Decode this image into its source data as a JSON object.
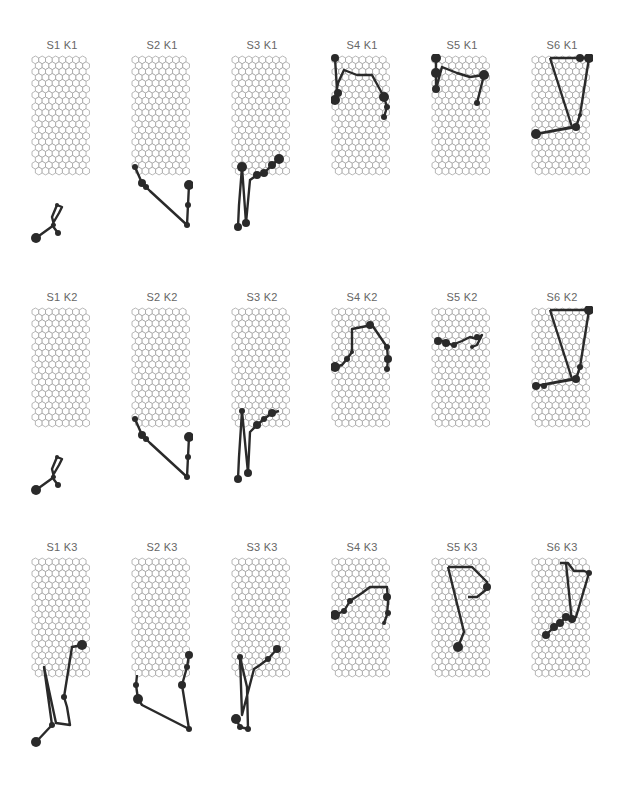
{
  "figure": {
    "grid": {
      "cols": 8,
      "rows": 20,
      "line_color": "#9a9a9a",
      "fill": "#ffffff"
    },
    "trajectory_color": "#2a2a2a",
    "rows": [
      {
        "row_label": "K1",
        "top": 39
      },
      {
        "row_label": "K2",
        "top": 291
      },
      {
        "row_label": "K3",
        "top": 541
      }
    ],
    "col_lefts": [
      31,
      131,
      231,
      331,
      431,
      531
    ],
    "panels": [
      {
        "title": "S1 K1",
        "row": 0,
        "col": 0,
        "path": [
          [
            4,
            183
          ],
          [
            22,
            170
          ],
          [
            20,
            162
          ],
          [
            25,
            150
          ],
          [
            30,
            152
          ],
          [
            27,
            158
          ],
          [
            20,
            170
          ],
          [
            26,
            178
          ]
        ],
        "dots": [
          [
            4,
            183,
            5
          ],
          [
            26,
            178,
            3
          ],
          [
            22,
            170,
            2
          ],
          [
            25,
            150,
            2
          ]
        ]
      },
      {
        "title": "S2 K1",
        "row": 0,
        "col": 1,
        "path": [
          [
            3,
            112
          ],
          [
            10,
            128
          ],
          [
            14,
            132
          ],
          [
            18,
            136
          ],
          [
            55,
            170
          ],
          [
            56,
            150
          ],
          [
            57,
            130
          ]
        ],
        "dots": [
          [
            3,
            112,
            3
          ],
          [
            10,
            128,
            4
          ],
          [
            14,
            132,
            3
          ],
          [
            55,
            170,
            3
          ],
          [
            56,
            150,
            3
          ],
          [
            57,
            130,
            5
          ]
        ]
      },
      {
        "title": "S3 K1",
        "row": 0,
        "col": 2,
        "path": [
          [
            6,
            172
          ],
          [
            7,
            150
          ],
          [
            10,
            112
          ],
          [
            14,
            168
          ],
          [
            18,
            125
          ],
          [
            25,
            120
          ],
          [
            32,
            118
          ],
          [
            40,
            110
          ],
          [
            47,
            104
          ]
        ],
        "dots": [
          [
            6,
            172,
            4
          ],
          [
            10,
            112,
            5
          ],
          [
            14,
            168,
            4
          ],
          [
            25,
            120,
            4
          ],
          [
            32,
            118,
            4
          ],
          [
            40,
            110,
            4
          ],
          [
            47,
            104,
            5
          ]
        ]
      },
      {
        "title": "S4 K1",
        "row": 0,
        "col": 3,
        "path": [
          [
            3,
            3
          ],
          [
            5,
            35
          ],
          [
            3,
            45
          ],
          [
            6,
            28
          ],
          [
            12,
            15
          ],
          [
            25,
            20
          ],
          [
            40,
            20
          ],
          [
            52,
            42
          ],
          [
            55,
            52
          ],
          [
            52,
            62
          ]
        ],
        "dots": [
          [
            3,
            3,
            4
          ],
          [
            3,
            45,
            5
          ],
          [
            6,
            38,
            4
          ],
          [
            52,
            42,
            5
          ],
          [
            55,
            52,
            3
          ],
          [
            52,
            62,
            3
          ]
        ]
      },
      {
        "title": "S5 K1",
        "row": 0,
        "col": 4,
        "path": [
          [
            4,
            3
          ],
          [
            4,
            18
          ],
          [
            4,
            34
          ],
          [
            10,
            12
          ],
          [
            25,
            18
          ],
          [
            38,
            22
          ],
          [
            52,
            20
          ],
          [
            45,
            48
          ]
        ],
        "dots": [
          [
            4,
            3,
            5
          ],
          [
            4,
            18,
            5
          ],
          [
            4,
            34,
            4
          ],
          [
            52,
            20,
            5
          ],
          [
            45,
            48,
            3
          ]
        ]
      },
      {
        "title": "S6 K1",
        "row": 0,
        "col": 5,
        "path": [
          [
            18,
            3
          ],
          [
            40,
            3
          ],
          [
            57,
            3
          ],
          [
            48,
            60
          ],
          [
            44,
            72
          ],
          [
            4,
            79
          ],
          [
            40,
            72
          ],
          [
            18,
            3
          ]
        ],
        "dots": [
          [
            4,
            79,
            5
          ],
          [
            44,
            72,
            4
          ],
          [
            57,
            3,
            5
          ],
          [
            48,
            3,
            4
          ],
          [
            48,
            60,
            2
          ]
        ]
      }
    ],
    "panels_k2": [
      {
        "title": "S1 K2",
        "row": 1,
        "col": 0,
        "path": [
          [
            4,
            183
          ],
          [
            22,
            170
          ],
          [
            20,
            162
          ],
          [
            25,
            150
          ],
          [
            30,
            152
          ],
          [
            27,
            158
          ],
          [
            20,
            170
          ],
          [
            26,
            178
          ]
        ],
        "dots": [
          [
            4,
            183,
            5
          ],
          [
            26,
            178,
            3
          ],
          [
            22,
            170,
            2
          ],
          [
            25,
            150,
            2
          ]
        ]
      },
      {
        "title": "S2 K2",
        "row": 1,
        "col": 1,
        "path": [
          [
            3,
            112
          ],
          [
            10,
            128
          ],
          [
            14,
            132
          ],
          [
            18,
            136
          ],
          [
            55,
            170
          ],
          [
            56,
            150
          ],
          [
            57,
            130
          ]
        ],
        "dots": [
          [
            3,
            112,
            3
          ],
          [
            10,
            128,
            4
          ],
          [
            14,
            132,
            3
          ],
          [
            55,
            170,
            3
          ],
          [
            56,
            150,
            3
          ],
          [
            57,
            130,
            5
          ]
        ]
      },
      {
        "title": "S3 K2",
        "row": 1,
        "col": 2,
        "path": [
          [
            6,
            172
          ],
          [
            7,
            150
          ],
          [
            10,
            104
          ],
          [
            16,
            166
          ],
          [
            18,
            125
          ],
          [
            25,
            118
          ],
          [
            32,
            112
          ],
          [
            40,
            106
          ],
          [
            47,
            104
          ]
        ],
        "dots": [
          [
            6,
            172,
            4
          ],
          [
            10,
            104,
            3
          ],
          [
            16,
            166,
            4
          ],
          [
            25,
            118,
            4
          ],
          [
            32,
            112,
            3
          ],
          [
            40,
            106,
            4
          ]
        ]
      },
      {
        "title": "S4 K2",
        "row": 1,
        "col": 3,
        "path": [
          [
            3,
            60
          ],
          [
            10,
            58
          ],
          [
            15,
            52
          ],
          [
            20,
            45
          ],
          [
            20,
            22
          ],
          [
            30,
            20
          ],
          [
            40,
            18
          ],
          [
            55,
            40
          ],
          [
            56,
            52
          ],
          [
            55,
            62
          ]
        ],
        "dots": [
          [
            3,
            60,
            5
          ],
          [
            15,
            52,
            3
          ],
          [
            20,
            45,
            2
          ],
          [
            38,
            18,
            4
          ],
          [
            55,
            40,
            3
          ],
          [
            56,
            52,
            4
          ],
          [
            55,
            62,
            3
          ]
        ]
      },
      {
        "title": "S5 K2",
        "row": 1,
        "col": 4,
        "path": [
          [
            4,
            34
          ],
          [
            12,
            34
          ],
          [
            20,
            38
          ],
          [
            30,
            34
          ],
          [
            38,
            30
          ],
          [
            45,
            32
          ],
          [
            50,
            28
          ],
          [
            45,
            38
          ],
          [
            40,
            40
          ]
        ],
        "dots": [
          [
            6,
            34,
            4
          ],
          [
            14,
            36,
            4
          ],
          [
            22,
            38,
            3
          ],
          [
            45,
            30,
            3
          ],
          [
            40,
            40,
            2
          ]
        ]
      },
      {
        "title": "S6 K2",
        "row": 1,
        "col": 5,
        "path": [
          [
            18,
            3
          ],
          [
            40,
            3
          ],
          [
            57,
            3
          ],
          [
            48,
            60
          ],
          [
            44,
            72
          ],
          [
            4,
            79
          ],
          [
            40,
            72
          ],
          [
            18,
            3
          ]
        ],
        "dots": [
          [
            4,
            79,
            4
          ],
          [
            12,
            79,
            3
          ],
          [
            44,
            72,
            4
          ],
          [
            57,
            3,
            5
          ],
          [
            48,
            60,
            3
          ]
        ]
      }
    ],
    "panels_k3": [
      {
        "title": "S1 K3",
        "row": 2,
        "col": 0,
        "path": [
          [
            4,
            185
          ],
          [
            20,
            168
          ],
          [
            12,
            110
          ],
          [
            24,
            166
          ],
          [
            38,
            168
          ],
          [
            35,
            150
          ],
          [
            32,
            140
          ],
          [
            40,
            90
          ],
          [
            50,
            88
          ]
        ],
        "dots": [
          [
            4,
            185,
            5
          ],
          [
            50,
            88,
            5
          ],
          [
            32,
            140,
            3
          ],
          [
            20,
            168,
            3
          ]
        ]
      },
      {
        "title": "S2 K3",
        "row": 2,
        "col": 1,
        "path": [
          [
            5,
            118
          ],
          [
            4,
            128
          ],
          [
            6,
            142
          ],
          [
            10,
            148
          ],
          [
            57,
            172
          ],
          [
            50,
            128
          ],
          [
            55,
            110
          ],
          [
            57,
            98
          ]
        ],
        "dots": [
          [
            6,
            142,
            5
          ],
          [
            4,
            128,
            3
          ],
          [
            57,
            172,
            3
          ],
          [
            50,
            128,
            4
          ],
          [
            55,
            110,
            3
          ],
          [
            57,
            98,
            4
          ]
        ]
      },
      {
        "title": "S3 K3",
        "row": 2,
        "col": 2,
        "path": [
          [
            4,
            162
          ],
          [
            8,
            170
          ],
          [
            16,
            172
          ],
          [
            15,
            130
          ],
          [
            8,
            100
          ],
          [
            10,
            158
          ],
          [
            22,
            112
          ],
          [
            28,
            108
          ],
          [
            36,
            102
          ],
          [
            45,
            92
          ]
        ],
        "dots": [
          [
            4,
            162,
            5
          ],
          [
            8,
            170,
            3
          ],
          [
            16,
            172,
            3
          ],
          [
            8,
            100,
            3
          ],
          [
            36,
            102,
            3
          ],
          [
            45,
            92,
            4
          ]
        ]
      },
      {
        "title": "S4 K3",
        "row": 2,
        "col": 3,
        "path": [
          [
            3,
            58
          ],
          [
            12,
            54
          ],
          [
            18,
            44
          ],
          [
            24,
            40
          ],
          [
            30,
            36
          ],
          [
            38,
            30
          ],
          [
            55,
            30
          ],
          [
            56,
            45
          ],
          [
            55,
            58
          ],
          [
            52,
            66
          ]
        ],
        "dots": [
          [
            3,
            58,
            5
          ],
          [
            12,
            54,
            3
          ],
          [
            18,
            44,
            3
          ],
          [
            55,
            40,
            4
          ],
          [
            56,
            56,
            3
          ],
          [
            52,
            66,
            2
          ]
        ]
      },
      {
        "title": "S5 K3",
        "row": 2,
        "col": 4,
        "path": [
          [
            16,
            10
          ],
          [
            40,
            10
          ],
          [
            55,
            25
          ],
          [
            55,
            32
          ],
          [
            45,
            40
          ],
          [
            36,
            40
          ]
        ],
        "dots": [
          [
            55,
            30,
            4
          ]
        ],
        "extra_path": [
          [
            16,
            10
          ],
          [
            32,
            75
          ],
          [
            26,
            90
          ]
        ],
        "extra_dots": [
          [
            26,
            90,
            5
          ]
        ]
      },
      {
        "title": "S6 K3",
        "row": 2,
        "col": 5,
        "path": [
          [
            28,
            6
          ],
          [
            36,
            6
          ],
          [
            42,
            14
          ],
          [
            52,
            14
          ],
          [
            57,
            16
          ],
          [
            44,
            60
          ],
          [
            40,
            65
          ],
          [
            34,
            6
          ]
        ],
        "dots": [
          [
            14,
            78,
            4
          ],
          [
            22,
            70,
            4
          ],
          [
            28,
            66,
            4
          ],
          [
            34,
            60,
            4
          ],
          [
            40,
            62,
            4
          ],
          [
            57,
            16,
            3
          ]
        ],
        "extra_path": [
          [
            40,
            62
          ],
          [
            34,
            60
          ],
          [
            28,
            66
          ],
          [
            22,
            70
          ],
          [
            14,
            78
          ]
        ]
      }
    ]
  }
}
